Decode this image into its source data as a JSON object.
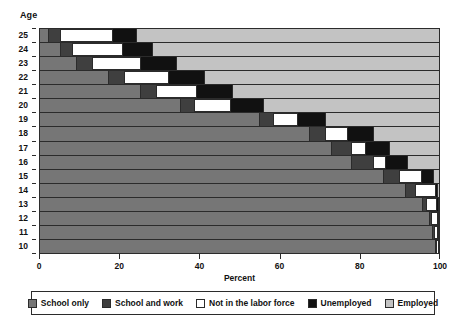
{
  "axes": {
    "y_title": "Age",
    "x_title": "Percent",
    "x_ticks": [
      "0",
      "20",
      "40",
      "60",
      "80",
      "100"
    ],
    "y_ticks": [
      "25",
      "24",
      "23",
      "22",
      "21",
      "20",
      "19",
      "18",
      "17",
      "16",
      "15",
      "14",
      "13",
      "12",
      "11",
      "10"
    ]
  },
  "legend": {
    "items": [
      {
        "label": "School only",
        "key": "sch-only",
        "color": "#767676"
      },
      {
        "label": "School and work",
        "key": "sch-work",
        "color": "#3f3f3f"
      },
      {
        "label": "Not in the labor force",
        "key": "nilf",
        "color": "#ffffff"
      },
      {
        "label": "Unemployed",
        "key": "unemp",
        "color": "#111111"
      },
      {
        "label": "Employed",
        "key": "emp",
        "color": "#c3c3c3"
      }
    ]
  },
  "chart_data": {
    "type": "bar",
    "orientation": "horizontal",
    "stacked": true,
    "normalized_percent": true,
    "title": "",
    "xlabel": "Percent",
    "ylabel": "Age",
    "xlim": [
      0,
      100
    ],
    "grid": false,
    "legend_position": "bottom",
    "categories": [
      "25",
      "24",
      "23",
      "22",
      "21",
      "20",
      "19",
      "18",
      "17",
      "16",
      "15",
      "14",
      "13",
      "12",
      "11",
      "10"
    ],
    "series": [
      {
        "name": "School only",
        "values": [
          2.0,
          5.0,
          9.0,
          17.0,
          25.0,
          35.0,
          55.0,
          67.5,
          73.0,
          78.0,
          86.0,
          91.5,
          96.0,
          97.5,
          98.5,
          99.0
        ]
      },
      {
        "name": "School and work",
        "values": [
          3.0,
          3.0,
          4.0,
          4.0,
          4.0,
          3.5,
          3.5,
          4.0,
          5.0,
          5.5,
          4.0,
          2.5,
          1.0,
          0.6,
          0.4,
          0.3
        ]
      },
      {
        "name": "Not in the labor force",
        "values": [
          13.0,
          12.5,
          12.0,
          11.0,
          10.0,
          9.0,
          6.0,
          5.5,
          3.5,
          3.0,
          5.5,
          5.0,
          2.5,
          1.4,
          0.8,
          0.5
        ]
      },
      {
        "name": "Unemployed",
        "values": [
          6.0,
          7.5,
          9.0,
          9.0,
          9.0,
          8.5,
          7.0,
          6.5,
          6.0,
          5.5,
          3.0,
          0.6,
          0.4,
          0.3,
          0.2,
          0.2
        ]
      },
      {
        "name": "Employed",
        "values": [
          76.0,
          72.0,
          66.0,
          59.0,
          52.0,
          44.0,
          28.5,
          16.5,
          12.5,
          8.0,
          1.5,
          0.4,
          0.1,
          0.2,
          0.1,
          0.0
        ]
      }
    ]
  }
}
